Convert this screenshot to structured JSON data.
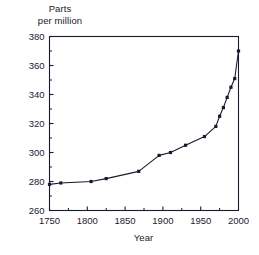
{
  "chart_data": {
    "type": "line",
    "title": "",
    "subtitle": "",
    "xlabel": "Year",
    "ylabel": "Parts\nper million",
    "ylabel_line1": "Parts",
    "ylabel_line2": "per million",
    "xlim": [
      1750,
      2000
    ],
    "ylim": [
      260,
      380
    ],
    "xticks": [
      1750,
      1800,
      1850,
      1900,
      1950,
      2000
    ],
    "xtick_labels": [
      "1750",
      "1800",
      "1850",
      "1900",
      "1950",
      "2000"
    ],
    "yticks": [
      260,
      280,
      300,
      320,
      340,
      360,
      380
    ],
    "ytick_labels": [
      "260",
      "280",
      "300",
      "320",
      "340",
      "360",
      "380"
    ],
    "y_minor_ticks": [
      270,
      290,
      310,
      330,
      350,
      370
    ],
    "grid": false,
    "legend": false,
    "legend_position": "none",
    "marker": "square",
    "line_color": "#1a1a2e",
    "marker_color": "#1a1a2e",
    "frame_color": "#1a1a2e",
    "background_color": "#ffffff",
    "x": [
      1750,
      1765,
      1805,
      1825,
      1868,
      1895,
      1910,
      1930,
      1955,
      1970,
      1975,
      1980,
      1985,
      1990,
      1995,
      2000
    ],
    "values": [
      278,
      279,
      280,
      282,
      287,
      298,
      300,
      305,
      311,
      318,
      325,
      331,
      338,
      345,
      351,
      370
    ],
    "series": [
      {
        "name": "Parts per million",
        "x": [
          1750,
          1765,
          1805,
          1825,
          1868,
          1895,
          1910,
          1930,
          1955,
          1970,
          1975,
          1980,
          1985,
          1990,
          1995,
          2000
        ],
        "values": [
          278,
          279,
          280,
          282,
          287,
          298,
          300,
          305,
          311,
          318,
          325,
          331,
          338,
          345,
          351,
          370
        ]
      }
    ]
  }
}
